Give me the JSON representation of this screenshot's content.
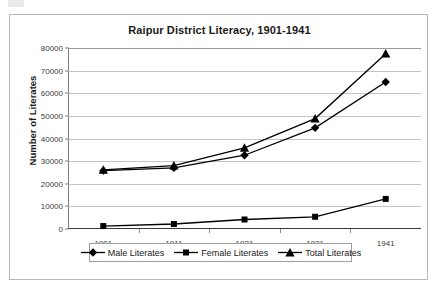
{
  "chart_data": {
    "type": "line",
    "title": "Raipur District Literacy, 1901-1941",
    "xlabel": "",
    "ylabel": "Number of Literates",
    "categories": [
      "1901",
      "1911",
      "1921",
      "1931",
      "1941"
    ],
    "ylim": [
      0,
      80000
    ],
    "ytick_labels": [
      "0",
      "10000",
      "20000",
      "30000",
      "40000",
      "50000",
      "60000",
      "70000",
      "80000"
    ],
    "ytick_values": [
      0,
      10000,
      20000,
      30000,
      40000,
      50000,
      60000,
      70000,
      80000
    ],
    "grid": true,
    "legend_position": "bottom",
    "series": [
      {
        "name": "Male Literates",
        "marker": "diamond",
        "color": "#000000",
        "values": [
          25800,
          27000,
          32600,
          44700,
          65000
        ]
      },
      {
        "name": "Female Literates",
        "marker": "square",
        "color": "#000000",
        "values": [
          1300,
          2200,
          4200,
          5400,
          13300
        ]
      },
      {
        "name": "Total Literates",
        "marker": "triangle",
        "color": "#000000",
        "values": [
          26100,
          28000,
          35900,
          48800,
          77500
        ]
      }
    ]
  },
  "legend": {
    "items": [
      {
        "label": "Male Literates",
        "marker": "diamond"
      },
      {
        "label": "Female Literates",
        "marker": "square"
      },
      {
        "label": "Total Literates",
        "marker": "triangle"
      }
    ]
  }
}
